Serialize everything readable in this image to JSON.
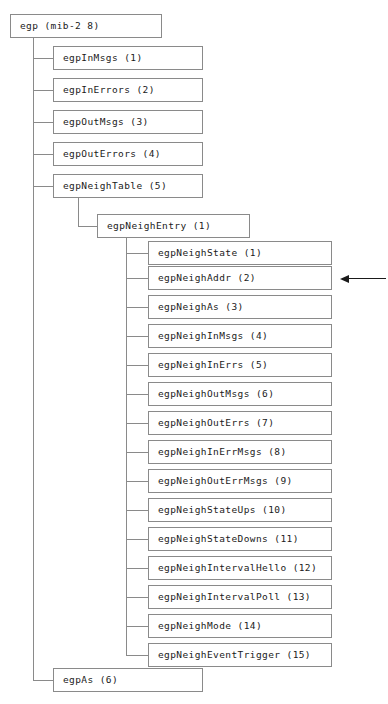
{
  "diagram": {
    "root": {
      "label": "egp (mib-2 8)",
      "x": 10,
      "y": 14,
      "width": 152
    },
    "children": [
      {
        "label": "egpInMsgs (1)",
        "y": 46
      },
      {
        "label": "egpInErrors (2)",
        "y": 78
      },
      {
        "label": "egpOutMsgs (3)",
        "y": 110
      },
      {
        "label": "egpOutErrors (4)",
        "y": 142
      },
      {
        "label": "egpNeighTable (5)",
        "y": 174
      },
      {
        "label": "egpAs (6)",
        "y": 668
      }
    ],
    "entry": {
      "label": "egpNeighEntry (1)",
      "y": 214
    },
    "leaves": [
      {
        "label": "egpNeighState (1)",
        "y": 241
      },
      {
        "label": "egpNeighAddr (2)",
        "y": 266
      },
      {
        "label": "egpNeighAs (3)",
        "y": 295
      },
      {
        "label": "egpNeighInMsgs (4)",
        "y": 324
      },
      {
        "label": "egpNeighInErrs (5)",
        "y": 353
      },
      {
        "label": "egpNeighOutMsgs (6)",
        "y": 382
      },
      {
        "label": "egpNeighOutErrs (7)",
        "y": 411
      },
      {
        "label": "egpNeighInErrMsgs (8)",
        "y": 440
      },
      {
        "label": "egpNeighOutErrMsgs (9)",
        "y": 469
      },
      {
        "label": "egpNeighStateUps (10)",
        "y": 498
      },
      {
        "label": "egpNeighStateDowns (11)",
        "y": 527
      },
      {
        "label": "egpNeighIntervalHello (12)",
        "y": 556
      },
      {
        "label": "egpNeighIntervalPoll (13)",
        "y": 585
      },
      {
        "label": "egpNeighMode (14)",
        "y": 614
      },
      {
        "label": "egpNeighEventTrigger (15)",
        "y": 643
      }
    ],
    "annotation": {
      "name": "pointer-arrow",
      "target_label": "egpNeighAddr (2)",
      "direction": "left",
      "y": 278,
      "x_start": 340,
      "x_end": 386
    },
    "colors": {
      "background": "#ffffff",
      "box_border": "#8a8a8a",
      "connector": "#8a8a8a",
      "text": "#1a1a1a",
      "arrow": "#1a1a1a"
    },
    "trunks": {
      "root_trunk_x": 33,
      "table_trunk_x": 78,
      "entry_trunk_x": 126
    }
  }
}
